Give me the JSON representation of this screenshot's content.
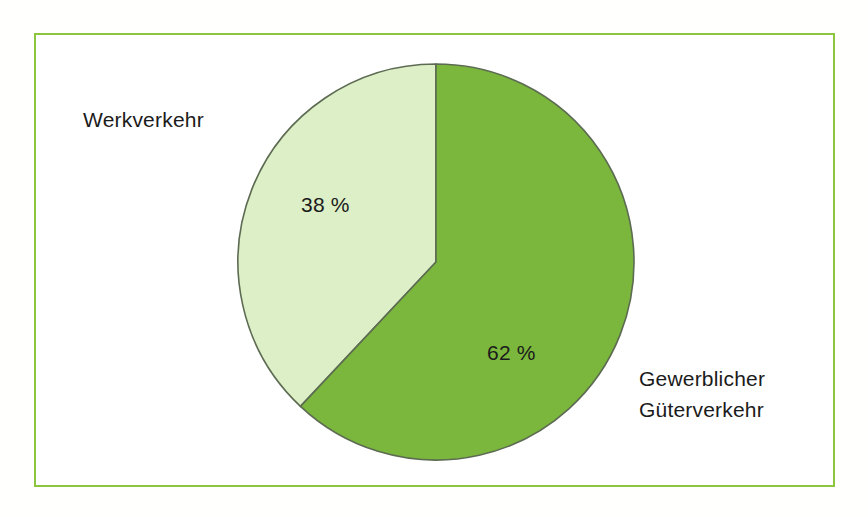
{
  "figure": {
    "background_color": "#ffffff",
    "frame_color": "#8cc63f"
  },
  "chart_data": {
    "type": "pie",
    "title": "",
    "subtitle": "",
    "xlabel": "",
    "ylabel": "",
    "legend_position": "none",
    "grid": false,
    "start_angle_deg": 0,
    "direction": "clockwise",
    "categories": [
      "Gewerblicher Güterverkehr",
      "Werkverkehr"
    ],
    "values": [
      62,
      38
    ],
    "unit": "%",
    "data_labels": [
      "62 %",
      "38 %"
    ],
    "colors": [
      "#7ab73c",
      "#dcefc6"
    ],
    "slice_outline_color": "#5d6b52",
    "slices": [
      {
        "name": "Gewerblicher Güterverkehr",
        "value": 62,
        "data_label": "62 %",
        "color": "#7ab73c",
        "label_line_1": "Gewerblicher",
        "label_line_2": "Güterverkehr"
      },
      {
        "name": "Werkverkehr",
        "value": 38,
        "data_label": "38 %",
        "color": "#dcefc6",
        "label_line_1": "Werkverkehr",
        "label_line_2": ""
      }
    ]
  },
  "labels": {
    "werkverkehr": "Werkverkehr",
    "gewerblicher_line1": "Gewerblicher",
    "gewerblicher_line2": "Güterverkehr",
    "pct_werkverkehr": "38 %",
    "pct_gewerblicher": "62 %"
  }
}
